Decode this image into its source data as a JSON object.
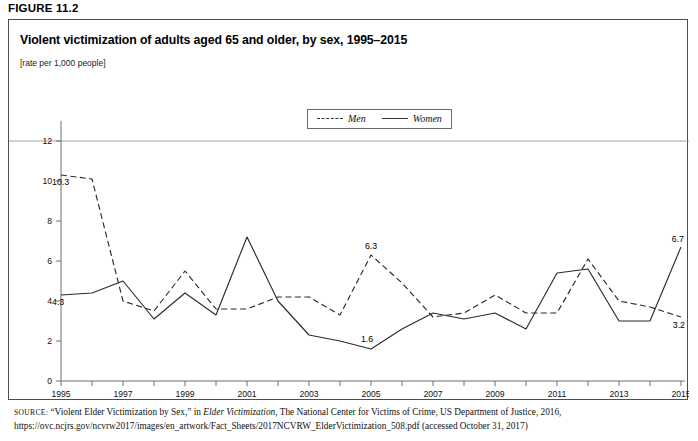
{
  "figure": {
    "label": "FIGURE 11.2",
    "title": "Violent victimization of adults aged 65 and older, by sex, 1995–2015",
    "subtitle": "[rate per 1,000 people]"
  },
  "legend": {
    "position": "top-center",
    "entries": [
      {
        "name": "Men",
        "style": "dashed",
        "icon": "dashed-line-icon"
      },
      {
        "name": "Women",
        "style": "solid",
        "icon": "solid-line-icon"
      }
    ]
  },
  "source": {
    "keyword": "SOURCE:",
    "line1": " “Violent Elder Victimization by Sex,” in ",
    "italic_title": "Elder Victimization",
    "line1_tail": ", The National Center for Victims of Crime, US Department of Justice, 2016,",
    "line2": "https://ovc.ncjrs.gov/ncvrw2017/images/en_artwork/Fact_Sheets/2017NCVRW_ElderVictimization_508.pdf (accessed October 31, 2017)"
  },
  "chart_data": {
    "type": "line",
    "title": "Violent victimization of adults aged 65 and older, by sex, 1995–2015",
    "subtitle": "[rate per 1,000 people]",
    "xlabel": "",
    "ylabel": "",
    "ylim": [
      0,
      12
    ],
    "yticks": [
      0,
      2,
      4,
      6,
      8,
      10,
      12
    ],
    "ytick_labels": [
      "0",
      "2",
      "4",
      "6",
      "8",
      "10",
      "12"
    ],
    "grid": false,
    "x": [
      1995,
      1996,
      1997,
      1998,
      1999,
      2000,
      2001,
      2002,
      2003,
      2004,
      2005,
      2006,
      2007,
      2008,
      2009,
      2010,
      2011,
      2012,
      2013,
      2014,
      2015
    ],
    "xtick_labels": [
      "1995",
      "",
      "1997",
      "",
      "1999",
      "",
      "2001",
      "",
      "2003",
      "",
      "2005",
      "",
      "2007",
      "",
      "2009",
      "",
      "2011",
      "",
      "2013",
      "",
      "2015"
    ],
    "xlim": [
      1995,
      2015
    ],
    "legend_position": "top-center",
    "series": [
      {
        "name": "Men",
        "style": "dashed",
        "values": [
          10.3,
          10.1,
          4.0,
          3.5,
          5.5,
          3.6,
          3.6,
          4.2,
          4.2,
          3.3,
          6.3,
          4.9,
          3.2,
          3.4,
          4.3,
          3.4,
          3.4,
          6.1,
          4.0,
          3.7,
          3.2
        ],
        "labels": [
          {
            "x": 1995,
            "y": 10.3,
            "text": "10.3"
          },
          {
            "x": 2005,
            "y": 6.3,
            "text": "6.3"
          },
          {
            "x": 2015,
            "y": 3.2,
            "text": "3.2"
          }
        ]
      },
      {
        "name": "Women",
        "style": "solid",
        "values": [
          4.3,
          4.4,
          5.0,
          3.1,
          4.4,
          3.3,
          7.2,
          4.0,
          2.3,
          2.0,
          1.6,
          2.6,
          3.4,
          3.1,
          3.4,
          2.6,
          5.4,
          5.6,
          3.0,
          3.0,
          6.7
        ],
        "labels": [
          {
            "x": 1995,
            "y": 4.3,
            "text": "4.3"
          },
          {
            "x": 2005,
            "y": 1.6,
            "text": "1.6"
          },
          {
            "x": 2015,
            "y": 6.7,
            "text": "6.7"
          }
        ]
      }
    ]
  }
}
